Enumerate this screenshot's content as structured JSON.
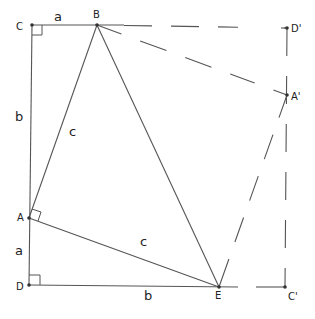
{
  "diagram": {
    "points": {
      "C": {
        "label": "C",
        "x": 32,
        "y": 25
      },
      "B": {
        "label": "B",
        "x": 97,
        "y": 25
      },
      "D_prime": {
        "label": "D'",
        "x": 287,
        "y": 28
      },
      "A_prime": {
        "label": "A'",
        "x": 287,
        "y": 95
      },
      "A": {
        "label": "A",
        "x": 29,
        "y": 218
      },
      "D": {
        "label": "D",
        "x": 29,
        "y": 285
      },
      "E": {
        "label": "E",
        "x": 219,
        "y": 287
      },
      "C_prime": {
        "label": "C'",
        "x": 285,
        "y": 287
      }
    },
    "side_labels": {
      "CB": "a",
      "CA": "b",
      "AB": "c",
      "AD": "a",
      "AE": "c",
      "DE": "b"
    },
    "solid_segments": [
      "C-B",
      "C-D",
      "B-A",
      "B-E",
      "A-E",
      "D-E"
    ],
    "dashed_segments": [
      "B-D'",
      "B-A'",
      "D'-C'",
      "A'-E",
      "E-C'"
    ],
    "right_angles": [
      "C",
      "A",
      "D"
    ],
    "colors": {
      "line": "#555555",
      "text": "#222222",
      "background": "#ffffff"
    }
  }
}
